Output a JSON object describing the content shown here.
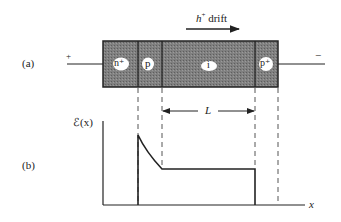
{
  "figure": {
    "panel_a_label": "(a)",
    "panel_b_label": "(b)",
    "drift_label_carrier": "h",
    "drift_label_sup": "+",
    "drift_label_text": " drift",
    "terminal_left": "+",
    "terminal_right": "−",
    "regions": [
      {
        "label": "n⁺"
      },
      {
        "label": "p"
      },
      {
        "label": "i"
      },
      {
        "label": "p⁺"
      }
    ],
    "length_label": "L",
    "y_axis_label": "ℰ(x)",
    "x_axis_label": "x"
  },
  "colors": {
    "device_fill": "#7a7a7a",
    "stroke": "#222222",
    "dashed": "#555555"
  }
}
